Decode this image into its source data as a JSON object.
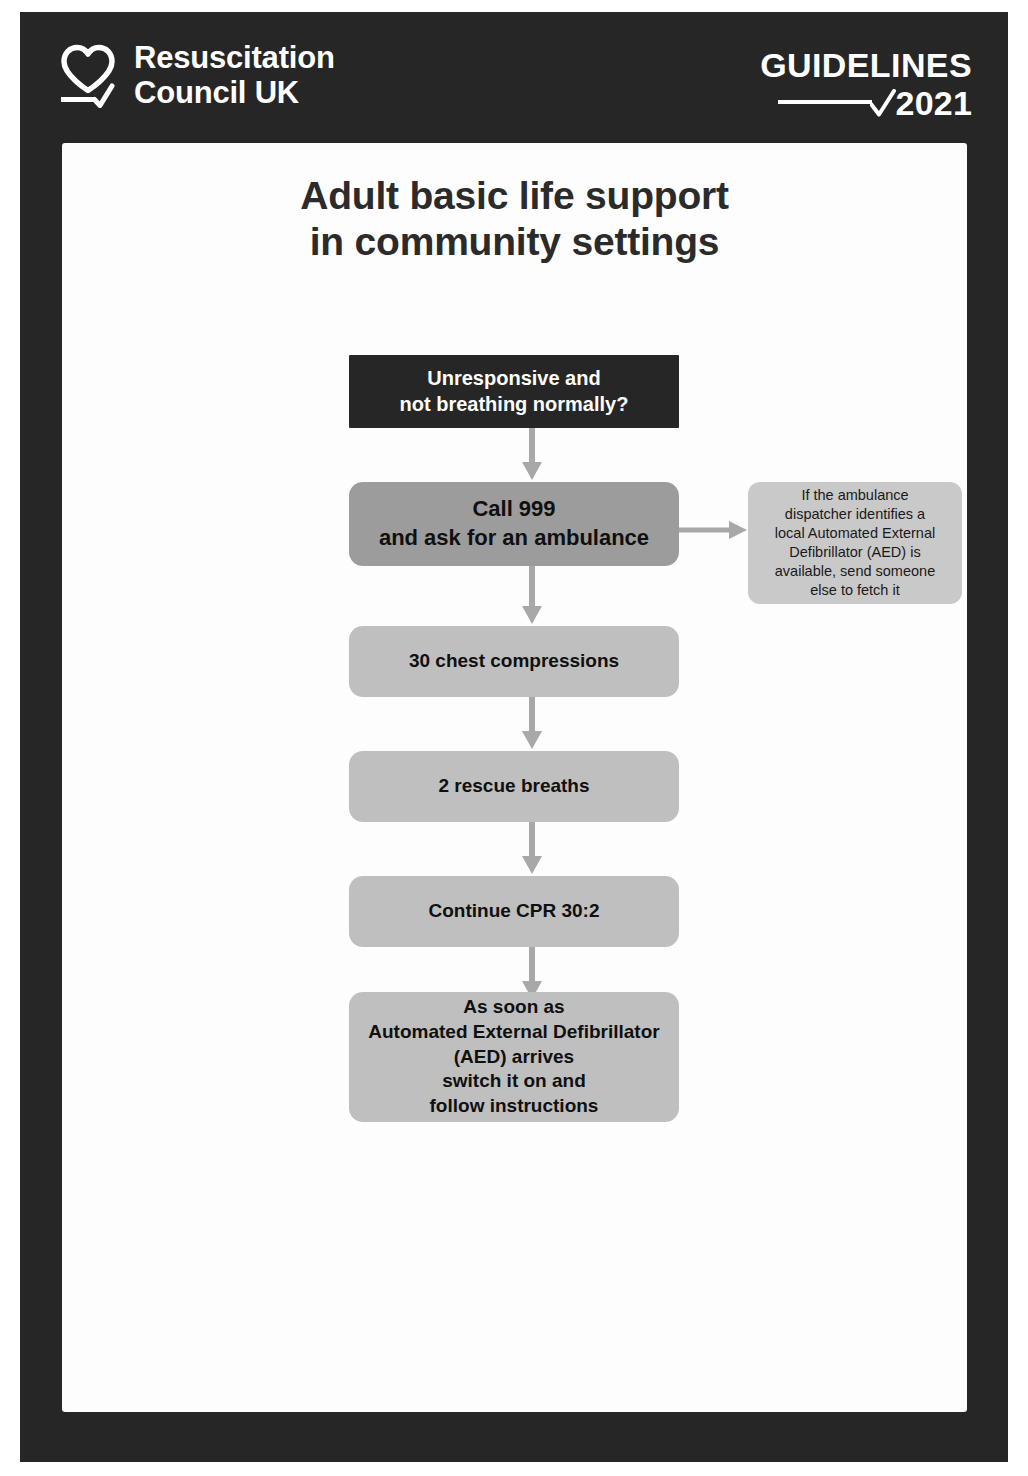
{
  "header": {
    "logo_icon": "heart-check-icon",
    "brand_name": "Resuscitation\nCouncil UK",
    "guidelines_label": "GUIDELINES",
    "guidelines_year": "2021",
    "tick_icon": "check-tick-icon",
    "background_color": "#262626",
    "text_color": "#ffffff"
  },
  "page": {
    "title": "Adult basic life support\nin community settings",
    "background_color": "#fdfdfd"
  },
  "flowchart": {
    "type": "flowchart",
    "orientation": "vertical",
    "nodes": [
      {
        "id": "assess",
        "label": "Unresponsive and\nnot breathing normally?",
        "style": "dark",
        "color": "#262626",
        "text_color": "#ffffff"
      },
      {
        "id": "call",
        "label": "Call 999\nand ask for an ambulance",
        "style": "mid",
        "color": "#9c9c9c",
        "text_color": "#101010"
      },
      {
        "id": "compressions",
        "label": "30 chest compressions",
        "style": "light",
        "color": "#bfbfbf",
        "text_color": "#101010"
      },
      {
        "id": "breaths",
        "label": "2 rescue breaths",
        "style": "light",
        "color": "#bfbfbf",
        "text_color": "#101010"
      },
      {
        "id": "cpr",
        "label": "Continue CPR 30:2",
        "style": "light",
        "color": "#bfbfbf",
        "text_color": "#101010"
      },
      {
        "id": "aed",
        "label": "As soon as\nAutomated External Defibrillator\n(AED) arrives\nswitch it on and\nfollow instructions",
        "style": "light",
        "color": "#bfbfbf",
        "text_color": "#101010"
      }
    ],
    "side_note": {
      "id": "aed-dispatch-note",
      "label": "If the ambulance\ndispatcher identifies a\nlocal Automated External\nDefibrillator (AED) is\navailable, send someone\nelse to fetch it",
      "color": "#c9c9c9",
      "text_color": "#1a1a1a",
      "attached_to": "call"
    },
    "connectors": [
      {
        "from": "assess",
        "to": "call",
        "direction": "down",
        "color": "#a8a8a8"
      },
      {
        "from": "call",
        "to": "aed-dispatch-note",
        "direction": "right",
        "color": "#a8a8a8"
      },
      {
        "from": "call",
        "to": "compressions",
        "direction": "down",
        "color": "#a8a8a8"
      },
      {
        "from": "compressions",
        "to": "breaths",
        "direction": "down",
        "color": "#a8a8a8"
      },
      {
        "from": "breaths",
        "to": "cpr",
        "direction": "down",
        "color": "#a8a8a8"
      },
      {
        "from": "cpr",
        "to": "aed",
        "direction": "down",
        "color": "#a8a8a8"
      }
    ]
  }
}
